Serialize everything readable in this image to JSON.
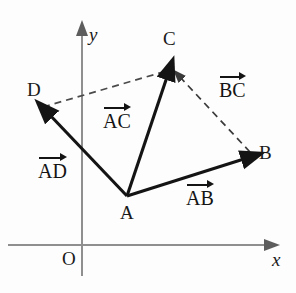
{
  "figure": {
    "colors": {
      "axis": "#8f8f8f",
      "vector": "#141414",
      "dashed": "#555555",
      "text": "#1a1a1a",
      "background": "#fdfdfd"
    },
    "axes": {
      "x_label": "x",
      "y_label": "y",
      "origin_label": "O",
      "origin_point": [
        82,
        245
      ],
      "x_axis_start": [
        8,
        245
      ],
      "x_axis_end": [
        274,
        245
      ],
      "y_axis_start": [
        82,
        276
      ],
      "y_axis_end": [
        82,
        25
      ]
    },
    "points": [
      {
        "name": "A",
        "label": "A",
        "x": 127,
        "y": 196,
        "label_x": 120,
        "label_y": 205
      },
      {
        "name": "B",
        "label": "B",
        "x": 252,
        "y": 155,
        "label_x": 258,
        "label_y": 143
      },
      {
        "name": "C",
        "label": "C",
        "x": 172,
        "y": 68,
        "label_x": 163,
        "label_y": 30
      },
      {
        "name": "D",
        "label": "D",
        "x": 43,
        "y": 107,
        "label_x": 27,
        "label_y": 80
      }
    ],
    "vectors": [
      {
        "name": "AB",
        "label": "AB",
        "from": "A",
        "to": "B",
        "style": "solid",
        "label_x": 186,
        "label_y": 182
      },
      {
        "name": "AC",
        "label": "AC",
        "from": "A",
        "to": "C",
        "style": "solid",
        "label_x": 103,
        "label_y": 105
      },
      {
        "name": "AD",
        "label": "AD",
        "from": "A",
        "to": "D",
        "style": "solid",
        "label_x": 38,
        "label_y": 155
      },
      {
        "name": "BC",
        "label": "BC",
        "from": "B",
        "to": "C",
        "style": "dashed",
        "label_x": 219,
        "label_y": 73
      }
    ],
    "dashed_segments": [
      {
        "name": "DC",
        "from": "D",
        "to": "C",
        "arrow": false
      }
    ]
  }
}
